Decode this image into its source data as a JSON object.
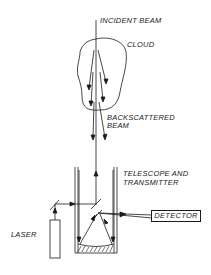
{
  "diagram": {
    "type": "lidar-schematic",
    "labels": {
      "incident_beam": "INCIDENT BEAM",
      "cloud": "CLOUD",
      "backscattered_line1": "BACKSCATTERED",
      "backscattered_line2": "BEAM",
      "telescope_line1": "TELESCOPE AND",
      "telescope_line2": "TRANSMITTER",
      "detector": "DETECTOR",
      "laser": "LASER"
    },
    "colors": {
      "ink": "#1a1a1a",
      "background": "#ffffff"
    }
  }
}
